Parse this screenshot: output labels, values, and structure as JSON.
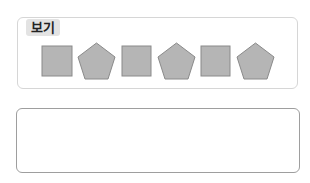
{
  "example_box": {
    "label": "보기",
    "shapes": [
      {
        "type": "square"
      },
      {
        "type": "pentagon"
      },
      {
        "type": "square"
      },
      {
        "type": "pentagon"
      },
      {
        "type": "square"
      },
      {
        "type": "pentagon"
      }
    ],
    "shape_fill": "#b5b5b5",
    "shape_stroke": "#8a8a8a"
  },
  "answer_box": {
    "value": ""
  }
}
